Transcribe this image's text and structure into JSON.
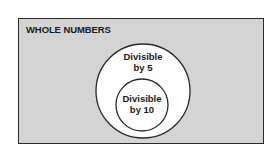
{
  "universe": {
    "label": "WHOLE NUMBERS",
    "fill": "#d4d4d4"
  },
  "sets": [
    {
      "id": "div5",
      "line1": "Divisible",
      "line2": "by 5",
      "fill": "#ffffff"
    },
    {
      "id": "div10",
      "line1": "Divisible",
      "line2": "by 10",
      "fill": "#ffffff"
    }
  ]
}
